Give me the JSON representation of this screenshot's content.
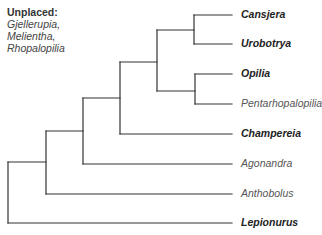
{
  "unplaced": {
    "heading": "Unplaced:",
    "genera": [
      "Gjellerupia,",
      "Melientha,",
      "Rhopalopilia"
    ]
  },
  "tree": {
    "line_color": "#333333",
    "leaf_end_x": 232,
    "leaves": [
      {
        "name": "Cansjera",
        "bold": true,
        "y": 15,
        "x0": 194
      },
      {
        "name": "Urobotrya",
        "bold": true,
        "y": 44,
        "x0": 194
      },
      {
        "name": "Opilia",
        "bold": true,
        "y": 74,
        "x0": 195
      },
      {
        "name": "Pentarhopalopilia",
        "bold": false,
        "y": 104,
        "x0": 195
      },
      {
        "name": "Champereia",
        "bold": true,
        "y": 134,
        "x0": 120
      },
      {
        "name": "Agonandra",
        "bold": false,
        "y": 164,
        "x0": 83
      },
      {
        "name": "Anthobolus",
        "bold": false,
        "y": 194,
        "x0": 46
      },
      {
        "name": "Lepionurus",
        "bold": true,
        "y": 223,
        "x0": 8
      }
    ],
    "nodes": [
      {
        "id": "A",
        "x": 194,
        "y1": 15,
        "y2": 44,
        "parent_x": 157,
        "mid": 30
      },
      {
        "id": "B",
        "x": 195,
        "y1": 74,
        "y2": 104,
        "parent_x": 157,
        "mid": 91
      },
      {
        "id": "C",
        "x": 157,
        "y1": 30,
        "y2": 91,
        "parent_x": 120,
        "mid": 62
      },
      {
        "id": "D",
        "x": 120,
        "y1": 62,
        "y2": 134,
        "parent_x": 83,
        "mid": 98
      },
      {
        "id": "E",
        "x": 83,
        "y1": 98,
        "y2": 164,
        "parent_x": 46,
        "mid": 131
      },
      {
        "id": "F",
        "x": 46,
        "y1": 131,
        "y2": 194,
        "parent_x": 8,
        "mid": 162
      },
      {
        "id": "root",
        "x": 8,
        "y1": 162,
        "y2": 223,
        "parent_x": null,
        "mid": null
      }
    ]
  }
}
